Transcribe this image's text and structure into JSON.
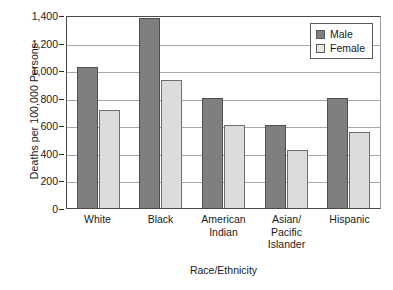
{
  "chart_data": {
    "type": "bar",
    "title": "",
    "xlabel": "Race/Ethnicity",
    "ylabel": "Deaths per 100,000 Persons",
    "categories": [
      "White",
      "Black",
      "American Indian",
      "Asian/Pacific Islander",
      "Hispanic"
    ],
    "category_lines": [
      [
        "White"
      ],
      [
        "Black"
      ],
      [
        "American",
        "Indian"
      ],
      [
        "Asian/",
        "Pacific",
        "Islander"
      ],
      [
        "Hispanic"
      ]
    ],
    "series": [
      {
        "name": "Male",
        "color": "#7f7f7f",
        "values": [
          1020,
          1375,
          800,
          600,
          800
        ]
      },
      {
        "name": "Female",
        "color": "#dcdcdc",
        "values": [
          710,
          930,
          600,
          420,
          550
        ]
      }
    ],
    "ylim": [
      0,
      1400
    ],
    "ytick_values": [
      0,
      200,
      400,
      600,
      800,
      1000,
      1200,
      1400
    ],
    "ytick_labels": [
      "0",
      "200",
      "400",
      "600",
      "800",
      "1,000",
      "1,200",
      "1,400"
    ],
    "grid": true,
    "legend_position": "top-right",
    "legend_entries": [
      "Male",
      "Female"
    ]
  }
}
